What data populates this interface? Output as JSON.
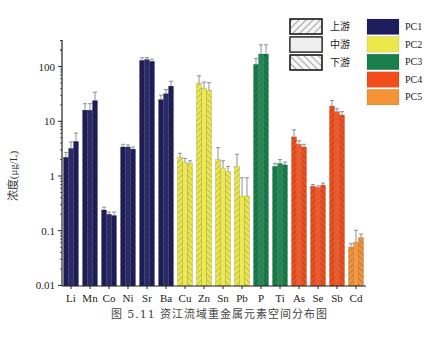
{
  "caption": "图 5.11   资江流域重金属元素空间分布图",
  "ylabel": "浓度(μg/L)",
  "colors": {
    "PC1": "#1e1d5e",
    "PC2": "#ece84a",
    "PC3": "#17804a",
    "PC4": "#f04f1c",
    "PC5": "#f49236"
  },
  "chart_data": {
    "type": "bar",
    "title": "资江流域重金属元素空间分布图",
    "xlabel": "",
    "ylabel": "浓度(μg/L)",
    "yscale": "log",
    "ylim": [
      0.01,
      300
    ],
    "yticks": [
      0.01,
      0.1,
      1,
      10,
      100
    ],
    "ytick_labels": [
      "0.01",
      "0.1",
      "1",
      "10",
      "100"
    ],
    "categories": [
      "Li",
      "Mn",
      "Co",
      "Ni",
      "Sr",
      "Ba",
      "Cu",
      "Zn",
      "Sn",
      "Pb",
      "P",
      "Ti",
      "As",
      "Se",
      "Sb",
      "Cd"
    ],
    "category_group": [
      "PC1",
      "PC1",
      "PC1",
      "PC1",
      "PC1",
      "PC1",
      "PC2",
      "PC2",
      "PC2",
      "PC2",
      "PC3",
      "PC3",
      "PC4",
      "PC4",
      "PC4",
      "PC5"
    ],
    "series": [
      {
        "name": "上游",
        "pattern": "hatch-forward",
        "values": [
          2.2,
          16,
          0.24,
          3.4,
          130,
          25,
          2.2,
          50,
          2.0,
          1.5,
          110,
          1.5,
          5.2,
          0.65,
          19,
          0.05
        ],
        "errors": [
          0.5,
          5,
          0.03,
          0.4,
          15,
          5,
          0.4,
          18,
          1.3,
          1.0,
          30,
          0.2,
          1.8,
          0.05,
          5,
          0.008
        ]
      },
      {
        "name": "中游",
        "pattern": "solid-light",
        "values": [
          3.2,
          16,
          0.2,
          3.4,
          135,
          32,
          1.8,
          40,
          1.4,
          0.43,
          170,
          1.7,
          3.8,
          0.62,
          15,
          0.062
        ],
        "errors": [
          1.0,
          5,
          0.02,
          0.3,
          12,
          6,
          0.3,
          12,
          0.5,
          0.5,
          80,
          0.3,
          0.6,
          0.04,
          2,
          0.04
        ]
      },
      {
        "name": "下游",
        "pattern": "hatch-back",
        "values": [
          4.3,
          24,
          0.19,
          3.1,
          125,
          44,
          1.7,
          37,
          1.2,
          0.43,
          170,
          1.6,
          3.4,
          0.68,
          13,
          0.075
        ],
        "errors": [
          1.8,
          10,
          0.03,
          0.3,
          12,
          10,
          0.2,
          14,
          0.3,
          0.5,
          80,
          0.2,
          0.4,
          0.06,
          2,
          0.012
        ]
      }
    ],
    "legend": {
      "position": "upper right",
      "patterns": [
        "上游",
        "中游",
        "下游"
      ],
      "groups": [
        "PC1",
        "PC2",
        "PC3",
        "PC4",
        "PC5"
      ]
    },
    "grid": false
  }
}
